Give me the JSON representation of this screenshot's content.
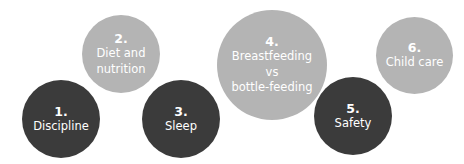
{
  "colors": {
    "dark": "#3b3b3b",
    "light": "#b4b4b4",
    "text": "#ffffff"
  },
  "topics": [
    {
      "number": "1.",
      "label": "Discipline",
      "tone": "dark"
    },
    {
      "number": "2.",
      "label": "Diet and\nnutrition",
      "tone": "light"
    },
    {
      "number": "3.",
      "label": "Sleep",
      "tone": "dark"
    },
    {
      "number": "4.",
      "label": "Breastfeeding\nvs\nbottle-feeding",
      "tone": "light"
    },
    {
      "number": "5.",
      "label": "Safety",
      "tone": "dark"
    },
    {
      "number": "6.",
      "label": "Child care",
      "tone": "light"
    }
  ]
}
